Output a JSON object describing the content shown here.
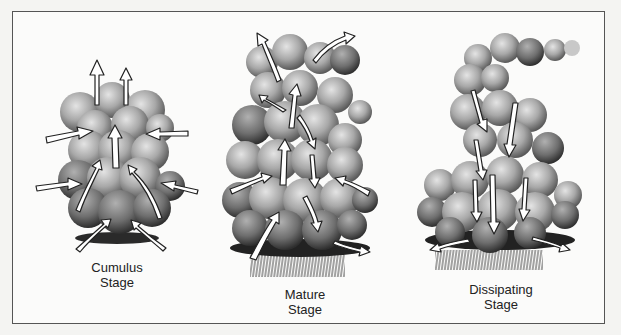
{
  "diagram": {
    "stages": [
      {
        "id": "cumulus",
        "label_line1": "Cumulus",
        "label_line2": "Stage",
        "airflow": "updrafts only; inflow from sides converging upward"
      },
      {
        "id": "mature",
        "label_line1": "Mature",
        "label_line2": "Stage",
        "airflow": "updrafts and downdrafts; rain falls from base; outflow at top and bottom"
      },
      {
        "id": "dissipating",
        "label_line1": "Dissipating",
        "label_line2": "Stage",
        "airflow": "downdrafts only; rain weakening; outflow at base"
      }
    ],
    "colors": {
      "frame": "#555555",
      "cloud_light": "#d8d8d8",
      "cloud_mid": "#9a9a9a",
      "cloud_dark": "#3a3a3a",
      "arrow_fill": "#ffffff",
      "arrow_stroke": "#222222"
    }
  }
}
